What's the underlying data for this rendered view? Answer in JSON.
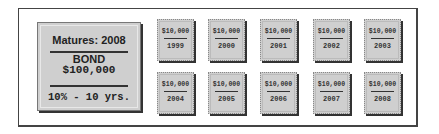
{
  "bond": {
    "matures": "Matures: 2008",
    "title": "BOND",
    "amount": "$100,000",
    "terms": "10% - 10 yrs."
  },
  "coupons": [
    {
      "amount": "$10,000",
      "year": "1999"
    },
    {
      "amount": "$10,000",
      "year": "2000"
    },
    {
      "amount": "$10,000",
      "year": "2001"
    },
    {
      "amount": "$10,000",
      "year": "2002"
    },
    {
      "amount": "$10,000",
      "year": "2003"
    },
    {
      "amount": "$10,000",
      "year": "2004"
    },
    {
      "amount": "$10,000",
      "year": "2005"
    },
    {
      "amount": "$10,000",
      "year": "2006"
    },
    {
      "amount": "$10,000",
      "year": "2007"
    },
    {
      "amount": "$10,000",
      "year": "2008"
    }
  ]
}
